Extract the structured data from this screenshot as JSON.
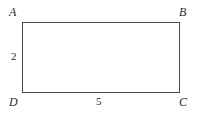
{
  "figure": {
    "kind": "rectangle-diagram",
    "background_color": "#ffffff",
    "stroke_color": "#4a4a4a",
    "text_color": "#2b2b2b",
    "vertices": [
      {
        "id": "a",
        "label": "A",
        "position": "top-left"
      },
      {
        "id": "b",
        "label": "B",
        "position": "top-right"
      },
      {
        "id": "c",
        "label": "C",
        "position": "bottom-right"
      },
      {
        "id": "d",
        "label": "D",
        "position": "bottom-left"
      }
    ],
    "measures": [
      {
        "id": "height",
        "label": "2",
        "side": "AD",
        "orientation": "vertical"
      },
      {
        "id": "width",
        "label": "5",
        "side": "DC",
        "orientation": "horizontal"
      }
    ]
  }
}
